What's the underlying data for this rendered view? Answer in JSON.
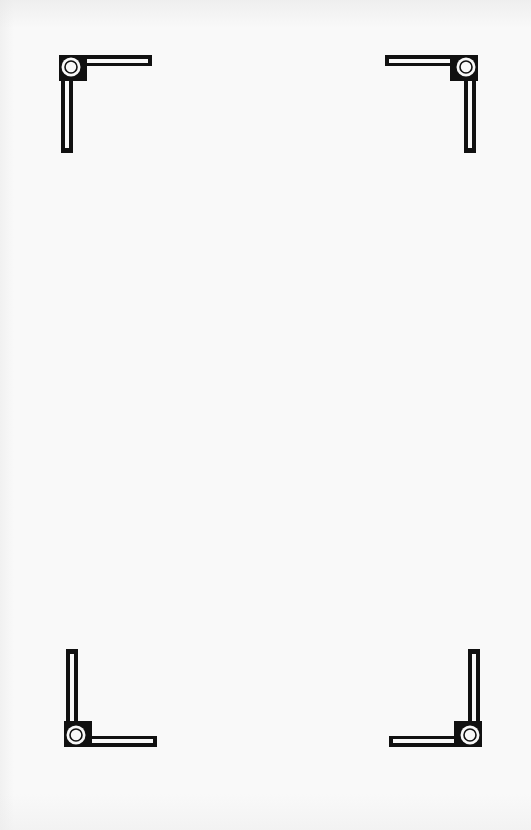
{
  "page": {
    "type": "blank-page",
    "background_color": "#f9f9f9",
    "ink_color": "#111111",
    "text": ""
  },
  "ornaments": [
    {
      "id": "top-left",
      "position": "top-left",
      "shape": "photo-corner-bracket"
    },
    {
      "id": "top-right",
      "position": "top-right",
      "shape": "photo-corner-bracket"
    },
    {
      "id": "bottom-left",
      "position": "bottom-left",
      "shape": "photo-corner-bracket"
    },
    {
      "id": "bottom-right",
      "position": "bottom-right",
      "shape": "photo-corner-bracket"
    }
  ]
}
